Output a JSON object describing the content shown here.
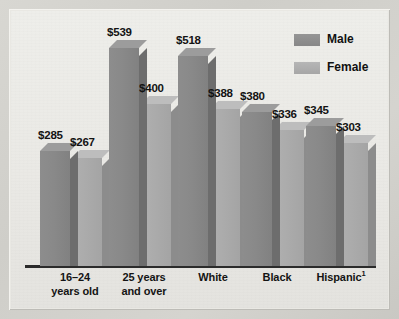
{
  "chart_data": {
    "type": "bar",
    "title": "",
    "subtitle": "",
    "xlabel": "",
    "ylabel": "",
    "ylim": [
      0,
      600
    ],
    "grid": false,
    "legend_position": "top-right",
    "categories": [
      "16–24 years old",
      "25 years and over",
      "White",
      "Black",
      "Hispanic¹"
    ],
    "category_lines": [
      [
        "16–24",
        "years old"
      ],
      [
        "25 years",
        "and over"
      ],
      [
        "White",
        ""
      ],
      [
        "Black",
        ""
      ],
      [
        "Hispanic¹",
        ""
      ]
    ],
    "series": [
      {
        "name": "Male",
        "values": [
          285,
          539,
          518,
          380,
          345
        ],
        "labels": [
          "$285",
          "$539",
          "$518",
          "$380",
          "$345"
        ],
        "color": "#898989"
      },
      {
        "name": "Female",
        "values": [
          267,
          400,
          388,
          336,
          303
        ],
        "labels": [
          "$267",
          "$400",
          "$388",
          "$336",
          "$303"
        ],
        "color": "#ababab"
      }
    ],
    "annotations": [
      "Hispanic category carries footnote marker 1"
    ]
  },
  "legend": {
    "items": [
      {
        "label": "Male",
        "swatch": "male-swatch"
      },
      {
        "label": "Female",
        "swatch": "female-swatch"
      }
    ]
  },
  "colors": {
    "male_front": "#898989",
    "male_side": "#6d6d6d",
    "male_top": "#9c9c9c",
    "female_front": "#ababab",
    "female_side": "#8c8c8c",
    "female_top": "#bdbdbd",
    "axis": "#2b2b2b",
    "plot_background": "#eae9e5",
    "frame": "#d4d3ce",
    "text": "#131313"
  }
}
